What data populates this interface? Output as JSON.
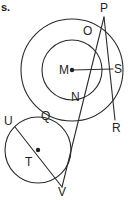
{
  "figure": {
    "kind": "geometry-diagram",
    "stroke_color": "#2b2b2b",
    "label_color": "#1f1f1f",
    "background_color": "#ffffff",
    "stroke_width": 1.1,
    "width": 135,
    "height": 200
  },
  "cropped_text": {
    "fragment": "s."
  },
  "circles": [
    {
      "name": "large-circle-m",
      "cx": 72,
      "cy": 70,
      "r": 51
    },
    {
      "name": "medium-circle-m",
      "cx": 72,
      "cy": 70,
      "r": 30
    },
    {
      "name": "small-circle-t",
      "cx": 38,
      "cy": 150,
      "r": 33
    }
  ],
  "centers": [
    {
      "name": "center-m",
      "cx": 72,
      "cy": 70,
      "r": 2.2
    },
    {
      "name": "center-t",
      "cx": 38,
      "cy": 150,
      "r": 2.2
    }
  ],
  "segments": [
    {
      "name": "segment-p-r",
      "x1": 104,
      "y1": 17,
      "x2": 115,
      "y2": 120
    },
    {
      "name": "segment-p-v",
      "x1": 104,
      "y1": 17,
      "x2": 62,
      "y2": 187
    },
    {
      "name": "segment-m-s",
      "x1": 72,
      "y1": 70,
      "x2": 113,
      "y2": 69
    },
    {
      "name": "segment-u-v",
      "x1": 15,
      "y1": 127,
      "x2": 62,
      "y2": 187
    }
  ],
  "labels": [
    {
      "name": "label-p",
      "text": "P",
      "x": 100,
      "y": 2
    },
    {
      "name": "label-o",
      "text": "O",
      "x": 83,
      "y": 25
    },
    {
      "name": "label-m",
      "text": "M",
      "x": 59,
      "y": 64
    },
    {
      "name": "label-s",
      "text": "S",
      "x": 114,
      "y": 63
    },
    {
      "name": "label-n",
      "text": "N",
      "x": 71,
      "y": 91
    },
    {
      "name": "label-q",
      "text": "Q",
      "x": 41,
      "y": 110
    },
    {
      "name": "label-u",
      "text": "U",
      "x": 4,
      "y": 115
    },
    {
      "name": "label-r",
      "text": "R",
      "x": 112,
      "y": 122
    },
    {
      "name": "label-t",
      "text": "T",
      "x": 25,
      "y": 156
    },
    {
      "name": "label-v",
      "text": "V",
      "x": 58,
      "y": 186
    }
  ]
}
